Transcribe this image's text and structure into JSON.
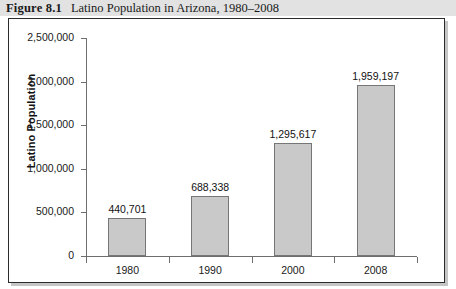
{
  "caption": {
    "figure_number": "Figure 8.1",
    "title": "Latino Population in Arizona, 1980–2008"
  },
  "chart_data": {
    "type": "bar",
    "title": "Latino Population in Arizona, 1980–2008",
    "xlabel": "",
    "ylabel": "Latino Population",
    "categories": [
      "1980",
      "1990",
      "2000",
      "2008"
    ],
    "values": [
      440701,
      688338,
      1295617,
      1959197
    ],
    "value_labels": [
      "440,701",
      "688,338",
      "1,295,617",
      "1,959,197"
    ],
    "ylim": [
      0,
      2500000
    ],
    "ytick_values": [
      0,
      500000,
      1000000,
      1500000,
      2000000,
      2500000
    ],
    "ytick_labels": [
      "0",
      "500,000",
      "1,000,000",
      "1,500,000",
      "2,000,000",
      "2,500,000"
    ],
    "grid": false,
    "legend": null,
    "bar_color": "#c9c9c9",
    "bar_border_color": "#767676",
    "axis_color": "#6e6e6e"
  }
}
